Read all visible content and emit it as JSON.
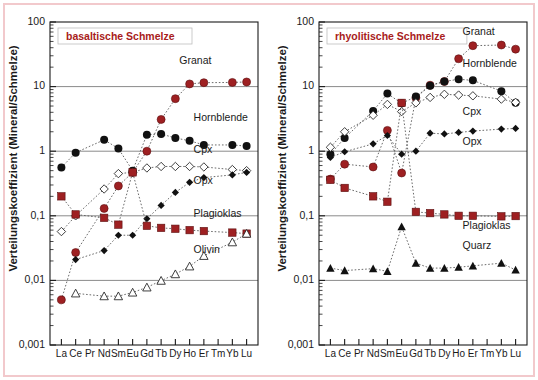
{
  "figure": {
    "background": "#ffffff",
    "frame_color": "#f2c9cc",
    "accent_red": "#9e2022",
    "grid_color": "#8a8a8a"
  },
  "chart_data": [
    {
      "type": "line",
      "panel": "left",
      "title": "basaltische Schmelze",
      "xlabel": "",
      "ylabel": "Verteilungskoeffizient (Mineral/Schmelze)",
      "categories": [
        "La",
        "Ce",
        "Pr",
        "Nd",
        "Sm",
        "Eu",
        "Gd",
        "Tb",
        "Dy",
        "Ho",
        "Er",
        "Tm",
        "Yb",
        "Lu"
      ],
      "ylim": [
        0.001,
        100
      ],
      "yticks": [
        "100",
        "10",
        "1",
        "0,1",
        "0,01",
        "0,001"
      ],
      "ytick_values": [
        100,
        10,
        1,
        0.1,
        0.01,
        0.001
      ],
      "log_scale": true,
      "grid": "horizontal-major",
      "legend_position": "inline-right",
      "series": [
        {
          "name": "Granat",
          "marker": "red-circle",
          "x": [
            "La",
            "Ce",
            "Nd",
            "Sm",
            "Eu",
            "Gd",
            "Tb",
            "Dy",
            "Ho",
            "Er",
            "Yb",
            "Lu"
          ],
          "values": [
            0.005,
            0.027,
            0.13,
            0.29,
            0.47,
            1.0,
            3.1,
            6.5,
            11.0,
            11.5,
            11.6,
            11.8
          ],
          "label_x": "Dy",
          "label_y": 22
        },
        {
          "name": "Hornblende",
          "marker": "black-circle",
          "x": [
            "La",
            "Ce",
            "Nd",
            "Sm",
            "Eu",
            "Gd",
            "Tb",
            "Dy",
            "Ho",
            "Er",
            "Yb",
            "Lu"
          ],
          "values": [
            0.56,
            0.95,
            1.5,
            1.1,
            0.5,
            1.8,
            1.85,
            1.6,
            1.45,
            1.25,
            1.25,
            1.2
          ],
          "label_x": "Ho",
          "label_y": 2.9
        },
        {
          "name": "Cpx",
          "marker": "open-diamond",
          "x": [
            "La",
            "Ce",
            "Nd",
            "Sm",
            "Eu",
            "Gd",
            "Tb",
            "Dy",
            "Ho",
            "Er",
            "Yb",
            "Lu"
          ],
          "values": [
            0.057,
            0.1,
            0.26,
            0.45,
            0.47,
            0.55,
            0.58,
            0.58,
            0.58,
            0.57,
            0.52,
            0.5
          ],
          "label_x": "Ho",
          "label_y": 0.95
        },
        {
          "name": "Opx",
          "marker": "black-diamond",
          "x": [
            "Ce",
            "Nd",
            "Sm",
            "Eu",
            "Gd",
            "Tb",
            "Dy",
            "Ho",
            "Er",
            "Yb",
            "Lu"
          ],
          "values": [
            0.021,
            0.029,
            0.05,
            0.05,
            0.09,
            0.145,
            0.23,
            0.33,
            0.39,
            0.43,
            0.47
          ],
          "label_x": "Ho",
          "label_y": 0.31
        },
        {
          "name": "Plagioklas",
          "marker": "red-square",
          "x": [
            "La",
            "Ce",
            "Nd",
            "Sm",
            "Eu",
            "Gd",
            "Tb",
            "Dy",
            "Ho",
            "Er",
            "Yb",
            "Lu"
          ],
          "values": [
            0.2,
            0.105,
            0.093,
            0.073,
            0.47,
            0.07,
            0.065,
            0.063,
            0.06,
            0.058,
            0.055,
            0.053
          ],
          "label_x": "Ho",
          "label_y": 0.095
        },
        {
          "name": "Olivin",
          "marker": "open-triangle",
          "x": [
            "Ce",
            "Nd",
            "Sm",
            "Eu",
            "Gd",
            "Tb",
            "Dy",
            "Ho",
            "Er",
            "Yb",
            "Lu"
          ],
          "values": [
            0.0063,
            0.0057,
            0.0057,
            0.0065,
            0.0078,
            0.0099,
            0.0125,
            0.0165,
            0.024,
            0.039,
            0.053
          ],
          "label_x": "Ho",
          "label_y": 0.027
        }
      ]
    },
    {
      "type": "line",
      "panel": "right",
      "title": "rhyolitische Schmelze",
      "xlabel": "",
      "ylabel": "Verteilungskoeffizient (Mineral/Schmelze)",
      "categories": [
        "La",
        "Ce",
        "Pr",
        "Nd",
        "Sm",
        "Eu",
        "Gd",
        "Tb",
        "Dy",
        "Ho",
        "Er",
        "Tm",
        "Yb",
        "Lu"
      ],
      "ylim": [
        0.001,
        100
      ],
      "yticks": [
        "100",
        "10",
        "1",
        "0,1",
        "0,01",
        "0,001"
      ],
      "ytick_values": [
        100,
        10,
        1,
        0.1,
        0.01,
        0.001
      ],
      "log_scale": true,
      "grid": "horizontal-major",
      "legend_position": "inline-right",
      "series": [
        {
          "name": "Granat",
          "marker": "red-circle",
          "x": [
            "La",
            "Ce",
            "Nd",
            "Sm",
            "Eu",
            "Gd",
            "Tb",
            "Dy",
            "Ho",
            "Er",
            "Yb",
            "Lu"
          ],
          "values": [
            0.37,
            0.63,
            0.57,
            2.1,
            0.46,
            6.7,
            10.5,
            12.0,
            27.0,
            43.0,
            44.0,
            38.0
          ],
          "label_x": "Ho",
          "label_y": 62
        },
        {
          "name": "Hornblende",
          "marker": "black-circle",
          "x": [
            "La",
            "Ce",
            "Nd",
            "Sm",
            "Eu",
            "Gd",
            "Tb",
            "Dy",
            "Ho",
            "Er",
            "Yb",
            "Lu"
          ],
          "values": [
            0.9,
            1.6,
            4.2,
            7.8,
            5.5,
            7.0,
            10.3,
            12.0,
            13.0,
            12.5,
            8.5,
            5.6
          ],
          "label_x": "Ho",
          "label_y": 20
        },
        {
          "name": "Cpx",
          "marker": "open-diamond",
          "x": [
            "La",
            "Ce",
            "Nd",
            "Sm",
            "Eu",
            "Gd",
            "Tb",
            "Dy",
            "Ho",
            "Er",
            "Yb",
            "Lu"
          ],
          "values": [
            1.15,
            2.0,
            3.6,
            5.3,
            4.1,
            5.6,
            6.8,
            7.6,
            7.4,
            7.2,
            6.4,
            5.7
          ],
          "label_x": "Ho",
          "label_y": 3.6
        },
        {
          "name": "Opx",
          "marker": "black-diamond",
          "x": [
            "La",
            "Ce",
            "Nd",
            "Sm",
            "Eu",
            "Gd",
            "Tb",
            "Dy",
            "Ho",
            "Er",
            "Yb",
            "Lu"
          ],
          "values": [
            0.8,
            0.98,
            1.3,
            1.75,
            0.9,
            1.0,
            1.9,
            1.85,
            1.95,
            2.05,
            2.2,
            2.25
          ],
          "label_x": "Ho",
          "label_y": 1.25
        },
        {
          "name": "Plagioklas",
          "marker": "red-square",
          "x": [
            "La",
            "Ce",
            "Nd",
            "Sm",
            "Eu",
            "Gd",
            "Tb",
            "Dy",
            "Ho",
            "Er",
            "Yb",
            "Lu"
          ],
          "values": [
            0.36,
            0.27,
            0.2,
            0.165,
            5.6,
            0.115,
            0.11,
            0.105,
            0.1,
            0.1,
            0.098,
            0.099
          ],
          "label_x": "Ho",
          "label_y": 0.062
        },
        {
          "name": "Quarz",
          "marker": "black-triangle",
          "x": [
            "La",
            "Ce",
            "Nd",
            "Sm",
            "Eu",
            "Gd",
            "Tb",
            "Dy",
            "Ho",
            "Er",
            "Yb",
            "Lu"
          ],
          "values": [
            0.0155,
            0.0142,
            0.0152,
            0.0138,
            0.068,
            0.0185,
            0.0155,
            0.0155,
            0.016,
            0.0168,
            0.0185,
            0.0145
          ],
          "label_x": "Ho",
          "label_y": 0.031
        }
      ]
    }
  ]
}
